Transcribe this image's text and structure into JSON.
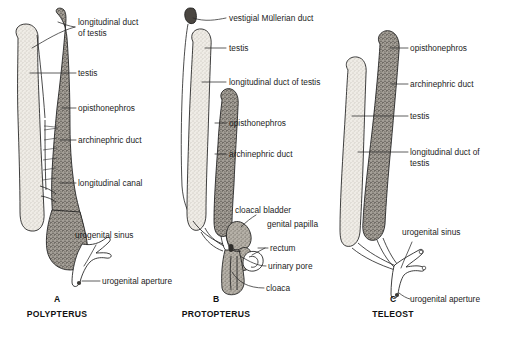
{
  "figure": {
    "background_color": "#ffffff",
    "ink_color": "#1c1c1c",
    "panels": [
      {
        "letter": "A",
        "name": "POLYPTERUS",
        "labels": [
          "longitudinal duct",
          "of testis",
          "testis",
          "opisthonephros",
          "archinephric duct",
          "longitudinal canal",
          "urogenital sinus",
          "urogenital aperture"
        ]
      },
      {
        "letter": "B",
        "name": "PROTOPTERUS",
        "labels": [
          "vestigial Müllerian duct",
          "testis",
          "longitudinal duct of testis",
          "opisthonephros",
          "archinephric duct",
          "cloacal bladder",
          "genital papilla",
          "rectum",
          "urinary pore",
          "cloaca"
        ]
      },
      {
        "letter": "C",
        "name": "TELEOST",
        "labels": [
          "opisthonephros",
          "archinephric duct",
          "testis",
          "longitudinal duct of",
          "testis",
          "urogenital sinus",
          "urogenital aperture"
        ]
      }
    ]
  },
  "panel_a": {
    "letter": "A",
    "name": "POLYPTERUS",
    "label_longitudinal_duct_l1": "longitudinal duct",
    "label_longitudinal_duct_l2": "of testis",
    "label_testis": "testis",
    "label_opisthonephros": "opisthonephros",
    "label_archinephric_duct": "archinephric duct",
    "label_longitudinal_canal": "longitudinal canal",
    "label_urogenital_sinus": "urogenital sinus",
    "label_urogenital_aperture": "urogenital aperture"
  },
  "panel_b": {
    "letter": "B",
    "name": "PROTOPTERUS",
    "label_vestigial_mullerian_duct": "vestigial Müllerian duct",
    "label_testis": "testis",
    "label_longitudinal_duct_of_testis": "longitudinal duct of testis",
    "label_opisthonephros": "opisthonephros",
    "label_archinephric_duct": "archinephric duct",
    "label_cloacal_bladder": "cloacal bladder",
    "label_genital_papilla": "genital papilla",
    "label_rectum": "rectum",
    "label_urinary_pore": "urinary pore",
    "label_cloaca": "cloaca"
  },
  "panel_c": {
    "letter": "C",
    "name": "TELEOST",
    "label_opisthonephros": "opisthonephros",
    "label_archinephric_duct": "archinephric duct",
    "label_testis": "testis",
    "label_longitudinal_duct_of_l1": "longitudinal duct of",
    "label_longitudinal_duct_of_l2": "testis",
    "label_urogenital_sinus": "urogenital sinus",
    "label_urogenital_aperture": "urogenital aperture"
  },
  "caption": {
    "cut_off_text": ""
  }
}
